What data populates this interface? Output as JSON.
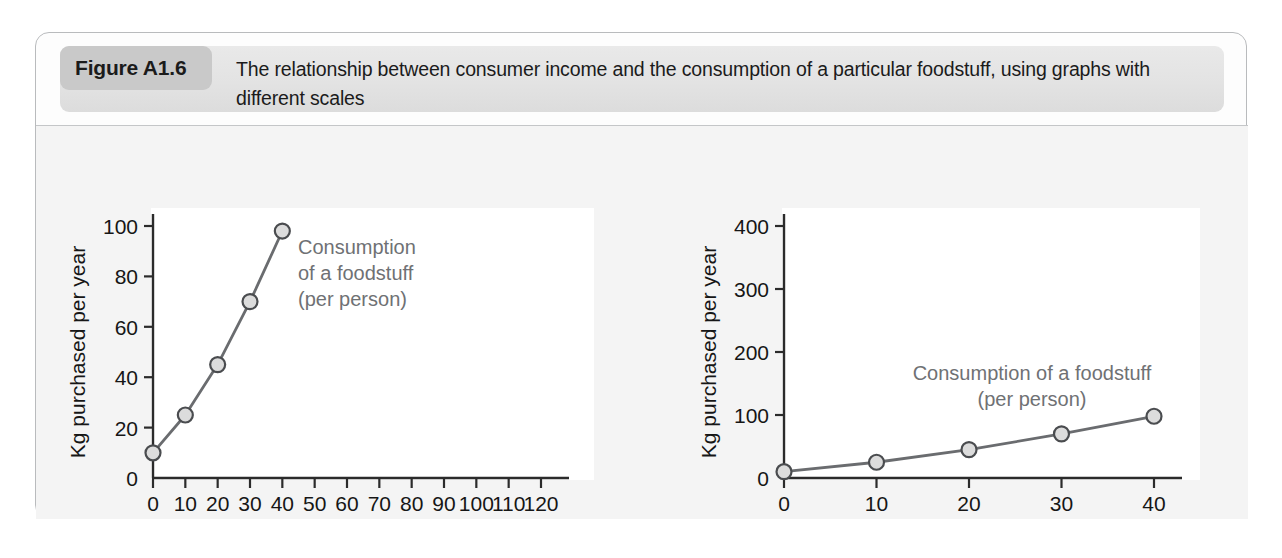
{
  "figure": {
    "number_label": "Figure A1.6",
    "title": "The relationship between consumer income and the consumption of a particular foodstuff, using graphs with different scales"
  },
  "colors": {
    "panel_border": "#b9bbbd",
    "banner_bg": "#e6e6e6",
    "chip_bg": "#c9c9c9",
    "plot_bg": "#ffffff",
    "figure_bg": "#f4f4f4",
    "axis": "#2b2b2b",
    "series_line": "#6a6c6f",
    "marker_fill": "#dcdcdc",
    "marker_stroke": "#4a4c4f",
    "annotation_text": "#6f7174"
  },
  "chart_data": [
    {
      "id": "chart-a",
      "type": "line",
      "panel_label": "(a)",
      "title": "",
      "xlabel": "Consumer income (£000 per year)",
      "ylabel": "Kg purchased per year",
      "annotation": [
        "Consumption",
        "of a foodstuff",
        "(per person)"
      ],
      "x": [
        0,
        10,
        20,
        30,
        40
      ],
      "values": [
        10,
        25,
        45,
        70,
        98
      ],
      "xlim": [
        0,
        120
      ],
      "ylim": [
        0,
        100
      ],
      "xticks": [
        0,
        10,
        20,
        30,
        40,
        50,
        60,
        70,
        80,
        90,
        100,
        110,
        120
      ],
      "yticks": [
        0,
        20,
        40,
        60,
        80,
        100
      ],
      "grid": false,
      "legend": "none"
    },
    {
      "id": "chart-b",
      "type": "line",
      "panel_label": "(b)",
      "title": "",
      "xlabel": "Consumer income (£000 per year)",
      "ylabel": "Kg purchased per year",
      "annotation": [
        "Consumption of a foodstuff",
        "(per person)"
      ],
      "x": [
        0,
        10,
        20,
        30,
        40
      ],
      "values": [
        10,
        25,
        45,
        70,
        98
      ],
      "xlim": [
        0,
        40
      ],
      "ylim": [
        0,
        400
      ],
      "xticks": [
        0,
        10,
        20,
        30,
        40
      ],
      "yticks": [
        0,
        100,
        200,
        300,
        400
      ],
      "grid": false,
      "legend": "none"
    }
  ]
}
